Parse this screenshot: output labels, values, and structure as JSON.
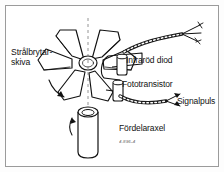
{
  "figure": {
    "language": "sv",
    "background_color": "#ffffff",
    "border_color": "#9b9b9b",
    "ink_color": "#111111"
  },
  "labels": {
    "disc_line1": "Strålbrytar-",
    "disc_line2": "skiva",
    "ir_diode": "Infraröd diod",
    "phototransistor": "Fototransistor",
    "signal_pulse": "Signalpuls",
    "distributor_shaft": "Fördelaraxel",
    "small_caption": "4.896-4"
  },
  "parts": [
    {
      "name": "shutter-disc",
      "label": "Strålbrytar-skiva",
      "vanes": 6
    },
    {
      "name": "ir-diode",
      "label": "Infraröd diod"
    },
    {
      "name": "phototransistor",
      "label": "Fototransistor"
    },
    {
      "name": "signal-pulse-wires",
      "label": "Signalpuls"
    },
    {
      "name": "distributor-shaft",
      "label": "Fördelaraxel"
    }
  ]
}
